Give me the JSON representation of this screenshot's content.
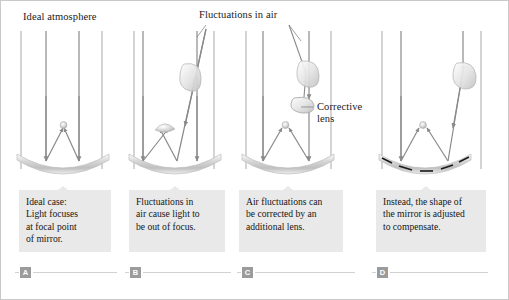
{
  "figure": {
    "annotations": {
      "ideal_atmosphere": "Ideal atmosphere",
      "fluctuations_in_air": "Fluctuations in air",
      "corrective_lens_line1": "Corrective",
      "corrective_lens_line2": "lens"
    },
    "colors": {
      "ray": "#8a8a8a",
      "mirror": "#cfcfcf",
      "caption_bg": "#e9e9e9",
      "marker_bg": "#9b9b9b",
      "border": "#c9c9c9",
      "segment_dash": "#1a1a1a"
    },
    "panels": [
      {
        "id": "A",
        "marker": "A",
        "caption_lines": [
          "Ideal case:",
          "Light focuses",
          "at focal point",
          "of mirror."
        ],
        "has_focal_point": true,
        "has_turbulence_lens": false,
        "has_corrective_lens": false,
        "mirror_type": "smooth",
        "ray_count": 4
      },
      {
        "id": "B",
        "marker": "B",
        "caption_lines": [
          "Fluctuations in",
          "air cause light to",
          "be out of focus."
        ],
        "has_focal_point": false,
        "has_turbulence_lens": true,
        "has_corrective_lens": false,
        "mirror_type": "smooth",
        "ray_count": 4
      },
      {
        "id": "C",
        "marker": "C",
        "caption_lines": [
          "Air fluctuations can",
          "be corrected by an",
          "additional lens."
        ],
        "has_focal_point": true,
        "has_turbulence_lens": true,
        "has_corrective_lens": true,
        "mirror_type": "smooth",
        "ray_count": 4
      },
      {
        "id": "D",
        "marker": "D",
        "caption_lines": [
          "Instead, the shape of",
          "the mirror is adjusted",
          "to compensate."
        ],
        "has_focal_point": true,
        "has_turbulence_lens": true,
        "has_corrective_lens": false,
        "mirror_type": "segmented-deformable",
        "segment_count": 5,
        "ray_count": 4
      }
    ]
  }
}
